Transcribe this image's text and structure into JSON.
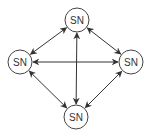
{
  "diagram": {
    "type": "network",
    "nodes": [
      {
        "id": "top",
        "label": "SN"
      },
      {
        "id": "left",
        "label": "SN"
      },
      {
        "id": "right",
        "label": "SN"
      },
      {
        "id": "bottom",
        "label": "SN"
      }
    ],
    "edges": [
      {
        "from": "top",
        "to": "left",
        "direction": "bidirectional"
      },
      {
        "from": "top",
        "to": "right",
        "direction": "bidirectional"
      },
      {
        "from": "top",
        "to": "bottom",
        "direction": "bidirectional"
      },
      {
        "from": "left",
        "to": "right",
        "direction": "bidirectional"
      },
      {
        "from": "left",
        "to": "bottom",
        "direction": "bidirectional"
      },
      {
        "from": "right",
        "to": "bottom",
        "direction": "bidirectional"
      }
    ],
    "colors": {
      "stroke": "#333333",
      "fill": "#ffffff"
    }
  }
}
